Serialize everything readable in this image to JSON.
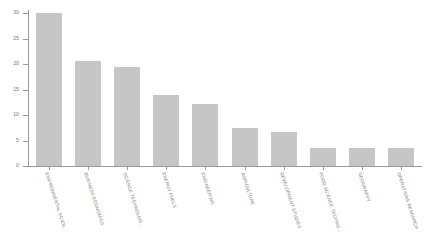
{
  "chart_data": {
    "type": "bar",
    "title": "",
    "subtitle": "",
    "xlabel": "",
    "ylabel": "",
    "ylim": [
      0,
      31
    ],
    "grid": false,
    "legend": false,
    "legend_position": "none",
    "orientation": "vertical",
    "bar_color": "#c6c6c6",
    "background_color": "#ffffff",
    "axis_color": "#9a9a9a",
    "tick_label_color": "#7a7a7a",
    "category_label_rotation_degrees": 72,
    "categories": [
      "ENVIRONMENTAL SCIEN...",
      "BUSINESS ECONOMICS",
      "SCIENCE TECHNOLOG...",
      "ENERGY FUELS",
      "ENGINEERING",
      "AGRICULTURE",
      "DEVELOPMENT STUDIES",
      "FOOD SCIENCE TECHNO...",
      "GEOGRAPHY",
      "OPERATIONS RESEARCH"
    ],
    "values": [
      30,
      20.5,
      19.5,
      14,
      12.2,
      7.5,
      6.7,
      3.5,
      3.5,
      3.5
    ],
    "yticks": [
      0,
      5,
      10,
      15,
      20,
      25,
      30
    ],
    "ytick_labels": [
      "0",
      "5",
      "10",
      "15",
      "20",
      "25",
      "30"
    ],
    "series": [
      {
        "name": "count",
        "values": [
          30,
          20.5,
          19.5,
          14,
          12.2,
          7.5,
          6.7,
          3.5,
          3.5,
          3.5
        ]
      }
    ]
  }
}
